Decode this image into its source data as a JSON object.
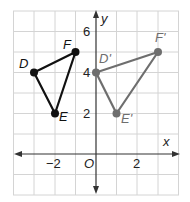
{
  "axes": {
    "x_label": "x",
    "y_label": "y",
    "origin_label": "O",
    "x_ticks": [
      {
        "value": -2,
        "label": "−2"
      },
      {
        "value": 2,
        "label": "2"
      }
    ],
    "y_ticks": [
      {
        "value": 2,
        "label": "2"
      },
      {
        "value": 4,
        "label": "4"
      },
      {
        "value": 6,
        "label": "6"
      }
    ],
    "x_range": [
      -4,
      4
    ],
    "y_range": [
      -2,
      7
    ],
    "grid": true
  },
  "triangles": [
    {
      "name": "DEF",
      "color": "#111111",
      "vertices": [
        {
          "label": "D",
          "x": -3,
          "y": 4
        },
        {
          "label": "E",
          "x": -2,
          "y": 2
        },
        {
          "label": "F",
          "x": -1,
          "y": 5
        }
      ]
    },
    {
      "name": "D'E'F'",
      "color": "#6e6e6e",
      "vertices": [
        {
          "label": "D'",
          "x": 0,
          "y": 4
        },
        {
          "label": "E'",
          "x": 1,
          "y": 2
        },
        {
          "label": "F'",
          "x": 3,
          "y": 5
        }
      ]
    }
  ],
  "colors": {
    "grid": "#d4d4d4",
    "axis": "#333333",
    "original": "#111111",
    "image": "#6e6e6e"
  }
}
